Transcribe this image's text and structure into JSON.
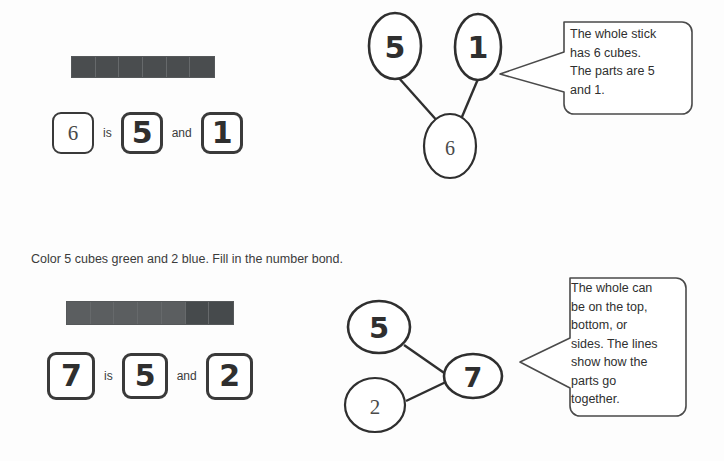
{
  "page": {
    "background_color": "#fdfdfd",
    "ink_color": "#3b3b3b"
  },
  "colors": {
    "cube_dark": "#4a4d4f",
    "cube_light": "#5b5e60",
    "cube_border": "#55585a",
    "box_border": "#3a3a3a",
    "callout_border": "#4a4a4a"
  },
  "problems": [
    {
      "id": "example-problem",
      "stick": {
        "label": "cube-stick-6",
        "total_cubes": 6,
        "cubes": [
          {
            "index": 1,
            "shade": "dark"
          },
          {
            "index": 2,
            "shade": "dark"
          },
          {
            "index": 3,
            "shade": "dark"
          },
          {
            "index": 4,
            "shade": "dark"
          },
          {
            "index": 5,
            "shade": "dark"
          },
          {
            "index": 6,
            "shade": "dark"
          }
        ]
      },
      "sentence": {
        "whole": "6",
        "whole_style": "printed",
        "connector_is": "is",
        "part_a": "5",
        "part_a_style": "handwritten",
        "connector_and": "and",
        "part_b": "1",
        "part_b_style": "handwritten"
      },
      "bond": {
        "layout": "whole-on-bottom",
        "whole": "6",
        "whole_style": "printed",
        "part_top_left": "5",
        "part_top_left_style": "handwritten",
        "part_top_right": "1",
        "part_top_right_style": "handwritten"
      },
      "callout": "The whole stick has 6 cubes. The parts are 5 and 1."
    },
    {
      "id": "practice-problem",
      "instruction": "Color 5 cubes green and 2 blue.  Fill in the number bond.",
      "stick": {
        "label": "cube-stick-7",
        "total_cubes": 7,
        "cubes": [
          {
            "index": 1,
            "shade": "light"
          },
          {
            "index": 2,
            "shade": "light"
          },
          {
            "index": 3,
            "shade": "light"
          },
          {
            "index": 4,
            "shade": "light"
          },
          {
            "index": 5,
            "shade": "light"
          },
          {
            "index": 6,
            "shade": "dark"
          },
          {
            "index": 7,
            "shade": "dark"
          }
        ]
      },
      "sentence": {
        "whole": "7",
        "whole_style": "handwritten",
        "connector_is": "is",
        "part_a": "5",
        "part_a_style": "handwritten",
        "connector_and": "and",
        "part_b": "2",
        "part_b_style": "handwritten"
      },
      "bond": {
        "layout": "whole-on-right",
        "whole": "7",
        "whole_style": "handwritten",
        "part_upper_left": "5",
        "part_upper_left_style": "handwritten",
        "part_lower_left": "2",
        "part_lower_left_style": "printed"
      },
      "callout": "The whole can be on the top, bottom, or sides.  The lines show how the parts go together."
    }
  ],
  "callout_lines": {
    "first": "The whole stick\nhas 6 cubes.\nThe parts are 5\nand 1.",
    "second": "The whole can\nbe on the top,\nbottom, or\nsides.  The lines\nshow how the\nparts go\ntogether."
  }
}
